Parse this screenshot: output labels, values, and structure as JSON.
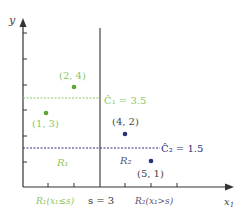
{
  "diagram": {
    "axes": {
      "x_label": "x",
      "x_label_sub": "1",
      "y_label": "y"
    },
    "split": {
      "label": "s = 3",
      "value": 3
    },
    "regions": [
      {
        "name": "R",
        "sub": "1",
        "center_label": "R₁",
        "axis_label": "R₁(x₁≤s)",
        "color": "#8dc665"
      },
      {
        "name": "R",
        "sub": "2",
        "center_label": "R₂",
        "axis_label": "R₂(x₁>s)",
        "color": "#6b6f9a"
      }
    ],
    "means": [
      {
        "label": "Ĉ₁ = 3.5",
        "value": 3.5,
        "color": "#8dc665"
      },
      {
        "label": "Ĉ₂ = 1.5",
        "value": 1.5,
        "color": "#2b2f7a"
      }
    ],
    "points": [
      {
        "x": 2,
        "y": 4,
        "label": "(2, 4)",
        "region": 1,
        "color": "#5aa832"
      },
      {
        "x": 1,
        "y": 3,
        "label": "(1, 3)",
        "region": 1,
        "color": "#5aa832"
      },
      {
        "x": 4,
        "y": 2,
        "label": "(4, 2)",
        "region": 2,
        "color": "#2b2f7a"
      },
      {
        "x": 5,
        "y": 1,
        "label": "(5, 1)",
        "region": 2,
        "color": "#2b2f7a"
      }
    ],
    "colors": {
      "axis": "#333333",
      "green": "#8dc665",
      "navy": "#2b2f7a",
      "gray_text": "#555577"
    }
  }
}
